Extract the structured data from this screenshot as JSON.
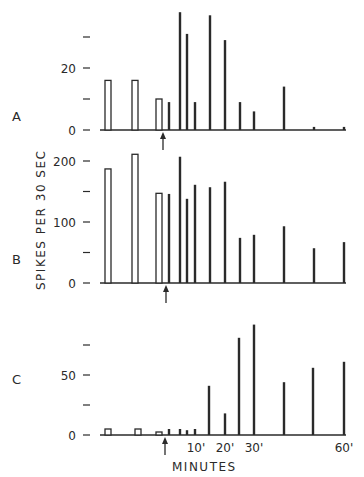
{
  "chart_data": [
    {
      "type": "bar",
      "panel": "A",
      "ylabel": "SPIKES PER 30 SEC",
      "xlabel": "MINUTES",
      "yticks": [
        0,
        10,
        20,
        30
      ],
      "ytick_labels": [
        "0",
        "",
        "20",
        ""
      ],
      "ylim": [
        0,
        40
      ],
      "arrow_x": 163,
      "bars": [
        {
          "x": 108,
          "value": 16,
          "style": "open"
        },
        {
          "x": 135,
          "value": 16,
          "style": "open"
        },
        {
          "x": 159,
          "value": 10,
          "style": "open"
        },
        {
          "x": 169,
          "value": 9,
          "style": "solid"
        },
        {
          "x": 180,
          "value": 38,
          "style": "solid"
        },
        {
          "x": 187,
          "value": 31,
          "style": "solid"
        },
        {
          "x": 195,
          "value": 9,
          "style": "solid"
        },
        {
          "x": 210,
          "value": 37,
          "style": "solid"
        },
        {
          "x": 225,
          "value": 29,
          "style": "solid"
        },
        {
          "x": 240,
          "value": 9,
          "style": "solid"
        },
        {
          "x": 254,
          "value": 6,
          "style": "solid"
        },
        {
          "x": 284,
          "value": 14,
          "style": "solid"
        },
        {
          "x": 314,
          "value": 1,
          "style": "solid"
        },
        {
          "x": 344,
          "value": 1,
          "style": "solid"
        }
      ]
    },
    {
      "type": "bar",
      "panel": "B",
      "ylabel": "SPIKES PER 30 SEC",
      "xlabel": "MINUTES",
      "yticks": [
        0,
        50,
        100,
        150,
        200
      ],
      "ytick_labels": [
        "0",
        "",
        "100",
        "",
        "200"
      ],
      "ylim": [
        0,
        220
      ],
      "arrow_x": 166,
      "bars": [
        {
          "x": 108,
          "value": 187,
          "style": "open"
        },
        {
          "x": 135,
          "value": 211,
          "style": "open"
        },
        {
          "x": 159,
          "value": 147,
          "style": "open"
        },
        {
          "x": 169,
          "value": 146,
          "style": "solid"
        },
        {
          "x": 180,
          "value": 207,
          "style": "solid"
        },
        {
          "x": 187,
          "value": 138,
          "style": "solid"
        },
        {
          "x": 195,
          "value": 161,
          "style": "solid"
        },
        {
          "x": 210,
          "value": 157,
          "style": "solid"
        },
        {
          "x": 225,
          "value": 166,
          "style": "solid"
        },
        {
          "x": 240,
          "value": 74,
          "style": "solid"
        },
        {
          "x": 254,
          "value": 79,
          "style": "solid"
        },
        {
          "x": 284,
          "value": 93,
          "style": "solid"
        },
        {
          "x": 314,
          "value": 57,
          "style": "solid"
        },
        {
          "x": 344,
          "value": 67,
          "style": "solid"
        }
      ]
    },
    {
      "type": "bar",
      "panel": "C",
      "ylabel": "SPIKES PER 30 SEC",
      "xlabel": "MINUTES",
      "yticks": [
        0,
        25,
        50,
        75
      ],
      "ytick_labels": [
        "0",
        "",
        "50",
        ""
      ],
      "ylim": [
        0,
        95
      ],
      "arrow_x": 165,
      "xtick_labels": [
        {
          "x": 196,
          "label": "10'"
        },
        {
          "x": 225,
          "label": "20'"
        },
        {
          "x": 254,
          "label": "30'"
        },
        {
          "x": 344,
          "label": "60'"
        }
      ],
      "bars": [
        {
          "x": 108,
          "value": 5,
          "style": "open"
        },
        {
          "x": 138,
          "value": 5,
          "style": "open"
        },
        {
          "x": 159,
          "value": 2.5,
          "style": "open"
        },
        {
          "x": 169,
          "value": 5,
          "style": "solid"
        },
        {
          "x": 180,
          "value": 5,
          "style": "solid"
        },
        {
          "x": 187,
          "value": 4,
          "style": "solid"
        },
        {
          "x": 195,
          "value": 5,
          "style": "solid"
        },
        {
          "x": 209,
          "value": 41,
          "style": "solid"
        },
        {
          "x": 225,
          "value": 18,
          "style": "solid"
        },
        {
          "x": 239,
          "value": 81,
          "style": "solid"
        },
        {
          "x": 254,
          "value": 92,
          "style": "solid"
        },
        {
          "x": 284,
          "value": 44,
          "style": "solid"
        },
        {
          "x": 313,
          "value": 56,
          "style": "solid"
        },
        {
          "x": 344,
          "value": 61,
          "style": "solid"
        }
      ]
    }
  ],
  "labels": {
    "panel_a": "A",
    "panel_b": "B",
    "panel_c": "C",
    "ylabel": "SPIKES PER 30 SEC",
    "xlabel": "MINUTES"
  }
}
